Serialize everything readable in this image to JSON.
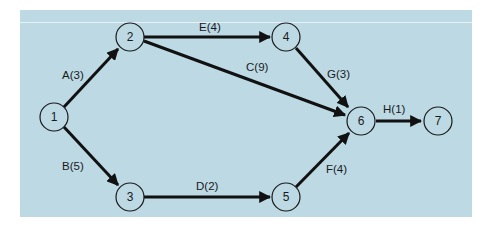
{
  "diagram": {
    "type": "activity-on-arrow network",
    "background_color": "#bcd9e4",
    "nodes": [
      {
        "id": "1",
        "label": "1",
        "x": 54,
        "y": 117
      },
      {
        "id": "2",
        "label": "2",
        "x": 130,
        "y": 37
      },
      {
        "id": "3",
        "label": "3",
        "x": 130,
        "y": 197
      },
      {
        "id": "4",
        "label": "4",
        "x": 286,
        "y": 37
      },
      {
        "id": "5",
        "label": "5",
        "x": 286,
        "y": 197
      },
      {
        "id": "6",
        "label": "6",
        "x": 361,
        "y": 121
      },
      {
        "id": "7",
        "label": "7",
        "x": 438,
        "y": 121
      }
    ],
    "edges": [
      {
        "from": "1",
        "to": "2",
        "label": "A(3)",
        "activity": "A",
        "duration": 3
      },
      {
        "from": "1",
        "to": "3",
        "label": "B(5)",
        "activity": "B",
        "duration": 5
      },
      {
        "from": "2",
        "to": "6",
        "label": "C(9)",
        "activity": "C",
        "duration": 9
      },
      {
        "from": "3",
        "to": "5",
        "label": "D(2)",
        "activity": "D",
        "duration": 2
      },
      {
        "from": "2",
        "to": "4",
        "label": "E(4)",
        "activity": "E",
        "duration": 4
      },
      {
        "from": "5",
        "to": "6",
        "label": "F(4)",
        "activity": "F",
        "duration": 4
      },
      {
        "from": "4",
        "to": "6",
        "label": "G(3)",
        "activity": "G",
        "duration": 3
      },
      {
        "from": "6",
        "to": "7",
        "label": "H(1)",
        "activity": "H",
        "duration": 1
      }
    ]
  }
}
